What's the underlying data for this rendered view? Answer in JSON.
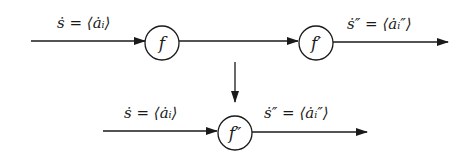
{
  "diagram": {
    "top_row": {
      "input_label": "ṡ = ⟨ȧᵢ⟩",
      "node_1": "f",
      "node_2": "f′",
      "output_label": "ṡ″ = ⟨ȧᵢ″⟩"
    },
    "transform_arrow": "down",
    "bottom_row": {
      "input_label": "ṡ = ⟨ȧᵢ⟩",
      "node": "f″",
      "output_label": "ṡ″ = ⟨ȧᵢ″⟩"
    },
    "colors": {
      "stroke": "#1a1a1a",
      "background": "#ffffff"
    }
  }
}
